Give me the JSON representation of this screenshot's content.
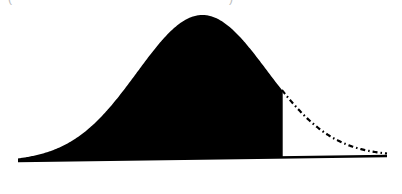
{
  "chart_data": {
    "type": "area",
    "title": "",
    "subtitle": "",
    "xlabel": "",
    "ylabel": "",
    "distribution": "normal",
    "mean_px": 202,
    "sigma_px": 65,
    "cutoff_z": 1.23,
    "shaded_region": "left of cutoff",
    "unshaded_tail_style": "dash-dot",
    "x_range_px": [
      18,
      387
    ],
    "peak_y_px": 15,
    "baseline_y_px": [
      161,
      156
    ],
    "grid": false,
    "legend": null,
    "colors": {
      "fill": "#000000",
      "line": "#000000",
      "background": "#ffffff"
    }
  },
  "top_remnants": {
    "left": "(",
    "right": ")"
  }
}
